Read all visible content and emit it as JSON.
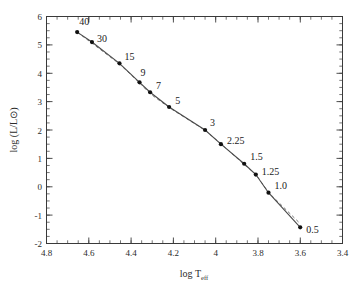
{
  "chart_data": {
    "type": "line",
    "title": "",
    "xlabel": "log T_eff",
    "ylabel": "log (L/L⊙)",
    "xlim": [
      4.8,
      3.4
    ],
    "ylim": [
      -2,
      6
    ],
    "x_ticks": [
      "4.8",
      "4.6",
      "4.4",
      "4.2",
      "4",
      "3.8",
      "3.6",
      "3.4"
    ],
    "x_tick_values": [
      4.8,
      4.6,
      4.4,
      4.2,
      4.0,
      3.8,
      3.6,
      3.4
    ],
    "y_ticks": [
      "6",
      "5",
      "4",
      "3",
      "2",
      "1",
      "0",
      "-1",
      "-2"
    ],
    "y_tick_values": [
      6,
      5,
      4,
      3,
      2,
      1,
      0,
      -1,
      -2
    ],
    "x_minor_step": 0.05,
    "y_minor_step": 0.25,
    "grid": false,
    "legend": "none",
    "axes_reversed_x": true,
    "series": [
      {
        "name": "ZAMS (solid)",
        "style": "solid-with-markers",
        "color": "#4a4a4a",
        "x": [
          4.655,
          4.585,
          4.455,
          4.36,
          4.31,
          4.22,
          4.05,
          3.975,
          3.865,
          3.81,
          3.75,
          3.6
        ],
        "y": [
          5.45,
          5.1,
          4.35,
          3.68,
          3.33,
          2.81,
          2.0,
          1.5,
          0.81,
          0.43,
          -0.21,
          -1.43
        ],
        "point_labels": [
          "40",
          "30",
          "15",
          "9",
          "7",
          "5",
          "3",
          "2.25",
          "1.5",
          "1.25",
          "1.0",
          "0.5"
        ]
      },
      {
        "name": "comparison (dashed)",
        "style": "dashed",
        "color": "#777777",
        "x": [
          4.655,
          4.585,
          4.455,
          4.36,
          4.31,
          4.22,
          4.05,
          3.975,
          3.865,
          3.81,
          3.75,
          3.6
        ],
        "y": [
          5.45,
          5.06,
          4.33,
          3.66,
          3.28,
          2.79,
          1.99,
          1.52,
          0.78,
          0.44,
          -0.2,
          -1.3
        ]
      }
    ],
    "point_label_text": {
      "p40": "40",
      "p30": "30",
      "p15": "15",
      "p9": "9",
      "p7": "7",
      "p5": "5",
      "p3": "3",
      "p225": "2.25",
      "p15b": "1.5",
      "p125": "1.25",
      "p10": "1.0",
      "p05": "0.5"
    },
    "axis_label_parts": {
      "x_main": "log T",
      "x_sub": "eff",
      "y_main": "log (L/L⊙)"
    }
  }
}
